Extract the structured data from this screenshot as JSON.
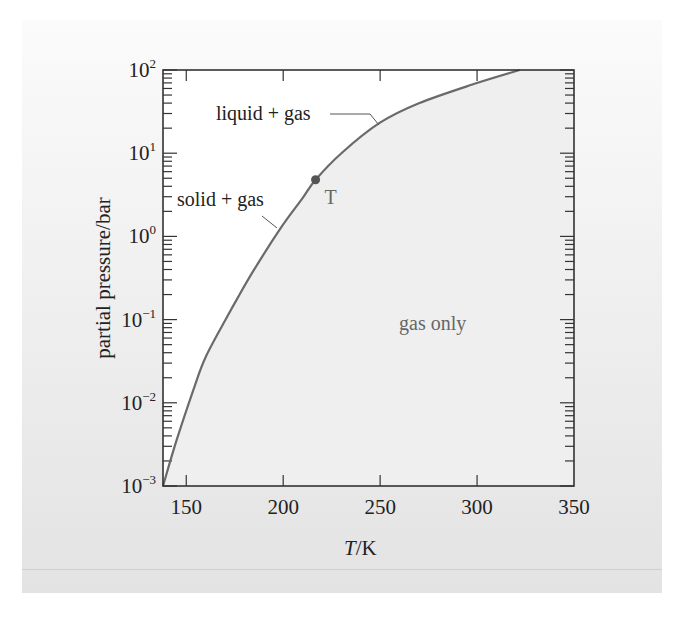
{
  "chart_data": {
    "type": "line",
    "title": "",
    "xlabel": "T/K",
    "xlabel_italic_part": "T",
    "xlabel_unit_part": "/K",
    "ylabel": "partial pressure/bar",
    "yscale": "log",
    "xlim": [
      138,
      350
    ],
    "ylim": [
      0.001,
      100
    ],
    "x_ticks": [
      150,
      200,
      250,
      300,
      350
    ],
    "x_tick_labels": [
      "150",
      "200",
      "250",
      "300",
      "350"
    ],
    "y_ticks": [
      0.001,
      0.01,
      0.1,
      1,
      10,
      100
    ],
    "y_tick_labels": [
      {
        "base": "10",
        "exp": "−3"
      },
      {
        "base": "10",
        "exp": "−2"
      },
      {
        "base": "10",
        "exp": "−1"
      },
      {
        "base": "10",
        "exp": "0"
      },
      {
        "base": "10",
        "exp": "1"
      },
      {
        "base": "10",
        "exp": "2"
      }
    ],
    "grid": false,
    "legend": null,
    "series": [
      {
        "name": "vapour pressure curve",
        "color": "#6a6a6a",
        "x": [
          138,
          145,
          153.6,
          160,
          171,
          176,
          185,
          199,
          210,
          216.7,
          230,
          249.5,
          270,
          299.5,
          322
        ],
        "log10_y": [
          -3.0,
          -2.45,
          -1.85,
          -1.45,
          -0.97,
          -0.76,
          -0.4,
          0.11,
          0.46,
          0.68,
          1.0,
          1.36,
          1.6,
          1.84,
          2.0
        ]
      }
    ],
    "points": [
      {
        "label": "T",
        "x": 216.7,
        "y": 4.8,
        "description": "triple point"
      }
    ],
    "annotations": [
      {
        "text": "liquid + gas",
        "region": "above curve, right of T"
      },
      {
        "text": "solid + gas",
        "region": "above curve, left of T"
      },
      {
        "text": "gas only",
        "region": "below/right of curve"
      },
      {
        "text": "T",
        "region": "triple point marker"
      }
    ],
    "colors": {
      "curve": "#6a6a6a",
      "gas_region_fill": "#efefef",
      "condensed_region_fill": "#ffffff",
      "axis": "#333333"
    }
  },
  "labels": {
    "liquid_gas": "liquid + gas",
    "solid_gas": "solid + gas",
    "gas_only": "gas only",
    "triple_point": "T",
    "xlabel_italic": "T",
    "xlabel_unit": "/K",
    "ylabel": "partial pressure/bar"
  }
}
